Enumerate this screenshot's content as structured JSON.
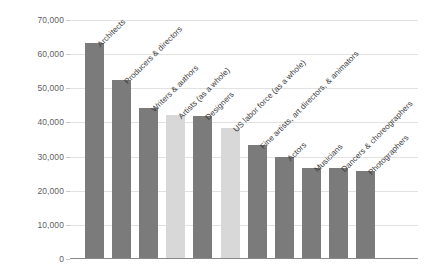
{
  "chart_data": {
    "type": "bar",
    "title": "",
    "xlabel": "",
    "ylabel": "Median Wage, $",
    "ylim": [
      0,
      70000
    ],
    "yticks": [
      "0",
      "10,000",
      "20,000",
      "30,000",
      "40,000",
      "50,000",
      "60,000",
      "70,000"
    ],
    "ytick_values": [
      0,
      10000,
      20000,
      30000,
      40000,
      50000,
      60000,
      70000
    ],
    "grid": true,
    "legend": "none",
    "categories": [
      "Architects",
      "Producers & directors",
      "Writers & authors",
      "Artists (as a whole)",
      "Designers",
      "US labor force (as a whole)",
      "Fine artists, art directors, & animators",
      "Actors",
      "Musicians",
      "Dancers & choreographers",
      "Photographers"
    ],
    "values": [
      63000,
      52000,
      44000,
      42000,
      41500,
      38000,
      33000,
      29500,
      26500,
      26500,
      25500
    ],
    "bar_styles": [
      "dark",
      "dark",
      "dark",
      "light",
      "dark",
      "light",
      "dark",
      "dark",
      "dark",
      "dark",
      "dark"
    ],
    "colors": {
      "bar_dark": "#7b7b7b",
      "bar_light": "#d8d8d8",
      "gridline": "#e2e2e2",
      "axis": "#8a8a8a",
      "tick_text": "#5f5f5f",
      "label_text": "#3b3b3b",
      "background": "#ffffff"
    }
  }
}
